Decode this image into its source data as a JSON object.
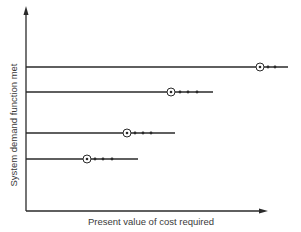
{
  "diagram": {
    "type": "option-cost-lines",
    "y_axis_label": "System demand function met",
    "x_axis_label": "Present value of cost required",
    "colors": {
      "ink": "#2a2a2a",
      "background": "#ffffff"
    },
    "axes": {
      "origin": [
        26,
        211
      ],
      "y_top": 6,
      "x_right": 268
    },
    "lines": [
      {
        "y": 67,
        "x_start": 26,
        "x_end": 288,
        "circle_x": 260,
        "dots_x": [
          268,
          275
        ]
      },
      {
        "y": 92,
        "x_start": 26,
        "x_end": 213,
        "circle_x": 171,
        "dots_x": [
          180,
          188,
          197
        ]
      },
      {
        "y": 133,
        "x_start": 26,
        "x_end": 175,
        "circle_x": 127,
        "dots_x": [
          135,
          143,
          151
        ]
      },
      {
        "y": 159,
        "x_start": 26,
        "x_end": 138,
        "circle_x": 87,
        "dots_x": [
          95,
          103,
          112
        ]
      }
    ]
  }
}
